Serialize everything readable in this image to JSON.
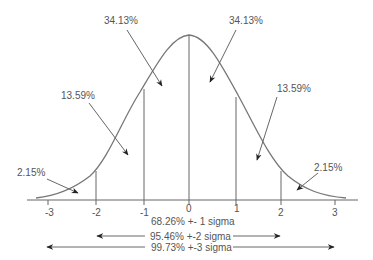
{
  "diagram": {
    "type": "normal-distribution",
    "axis": {
      "ticks": [
        "-3",
        "-2",
        "-1",
        "0",
        "1",
        "2",
        "3"
      ]
    },
    "region_labels": {
      "center_left": "34.13%",
      "center_right": "34.13%",
      "mid_left": "13.59%",
      "mid_right": "13.59%",
      "tail_left": "2.15%",
      "tail_right": "2.15%"
    },
    "range_labels": {
      "one_sigma": "68.26% +- 1 sigma",
      "two_sigma": "95.46% +-2 sigma",
      "three_sigma": "99.73% +-3 sigma"
    },
    "colors": {
      "line": "#666666",
      "text": "#555555",
      "background": "#ffffff"
    }
  }
}
